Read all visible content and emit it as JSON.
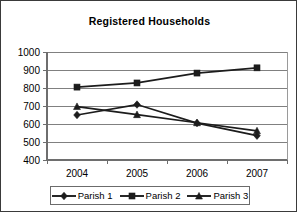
{
  "chart_data": {
    "type": "line",
    "title": "Registered Households",
    "xlabel": "",
    "ylabel": "",
    "x": [
      "2004",
      "2005",
      "2006",
      "2007"
    ],
    "categories": [
      "2004",
      "2005",
      "2006",
      "2007"
    ],
    "ylim": [
      400,
      1000
    ],
    "ytick_labels": [
      "1000",
      "900",
      "800",
      "700",
      "600",
      "500",
      "400"
    ],
    "ytick_values": [
      1000,
      900,
      800,
      700,
      600,
      500,
      400
    ],
    "grid": true,
    "legend_position": "bottom",
    "series": [
      {
        "name": "Parish 1",
        "marker": "diamond",
        "values": [
          650,
          708,
          605,
          535
        ]
      },
      {
        "name": "Parish 2",
        "marker": "square",
        "values": [
          805,
          828,
          883,
          912
        ]
      },
      {
        "name": "Parish 3",
        "marker": "triangle",
        "values": [
          697,
          652,
          607,
          562
        ]
      }
    ],
    "colors": {
      "series_line": "#1c1c1c",
      "gridline": "#808080",
      "axis": "#6e6e6e",
      "background": "#ffffff",
      "text": "#000000"
    }
  },
  "legend": {
    "items": [
      {
        "label": "Parish 1",
        "marker": "diamond"
      },
      {
        "label": "Parish 2",
        "marker": "square"
      },
      {
        "label": "Parish 3",
        "marker": "triangle"
      }
    ]
  }
}
